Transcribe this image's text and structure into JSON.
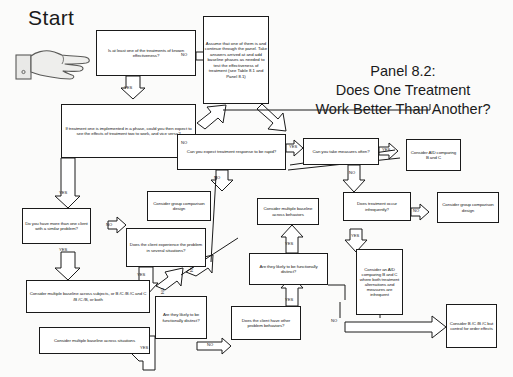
{
  "page": {
    "start_label": "Start",
    "hand_icon": "pointing-hand-icon",
    "background_color": "#fbfbfa",
    "line_color": "#1a1a1a"
  },
  "title": {
    "line1": "Panel 8.2:",
    "line2": "Does One Treatment",
    "line3": "Work Better Than Another?"
  },
  "callout": {
    "text": "Assume that one of them is and continue through the panel. Take answers arrived at and add baseline phases as needed to test the effectiveness of treatment (see Table 8.1 and Panel 8.1)"
  },
  "nodes": {
    "q_known_effectiveness": "Is at least one of the treatments of known effectiveness?",
    "q_treatment_one_phase": "If treatment one is implemented in a phase, could you then expect to see the effects of treatment two to work, and vice versa?",
    "q_response_rapid": "Can you expect treatment response to be rapid?",
    "q_measures_often": "Can you take measures often?",
    "q_more_than_one_client": "Do you have more than one client with a similar problem?",
    "q_problem_several_situations": "Does the client experience the problem in several situations?",
    "q_functionally_distinct_situations": "Are they likely to be functionally distinct?",
    "q_other_problem_behaviors": "Does the client have other problem behaviors?",
    "q_functionally_distinct_behaviors": "Are they likely to be functionally distinct?",
    "q_treatment_infrequent": "Does treatment occur infrequently?",
    "r_group_comparison_mid": "Consider group comparison design",
    "r_group_comparison_right": "Consider group comparison design",
    "r_mb_across_subjects": "Consider multiple baseline across subjects, or B /C /B /C and C /B /C /B, or both",
    "r_mb_across_situations": "Consider multiple baseline across situations",
    "r_mb_across_behaviors": "Consider multiple baseline across behaviors",
    "r_aid_b_and_c": "Consider AID comparing B and C",
    "r_aid_both_infrequent": "Consider an AID comparing B and C where both treatment alternations and measures are infrequent",
    "r_bcbc_order_effects": "Consider B /C /B /C but control for order effects"
  },
  "edge_labels": {
    "no1": "NO",
    "yes1": "YES",
    "no2": "NO",
    "yes2": "YES",
    "no3": "NO",
    "yes3": "YES",
    "no4": "NO",
    "yes4": "YES",
    "no5": "NO",
    "yes5": "YES",
    "yes6": "YES",
    "no6": "NO",
    "yes7": "YES",
    "no7": "NO",
    "yes8": "YES",
    "no8": "NO",
    "yes9": "YES",
    "no9": "NO",
    "no10": "NO",
    "no11": "NO"
  }
}
